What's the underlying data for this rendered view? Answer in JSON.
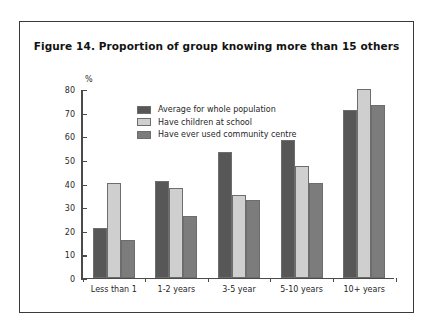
{
  "figure": {
    "title": "Figure 14. Proportion of group knowing more than 15 others"
  },
  "chart_data": {
    "type": "bar",
    "title": "Figure 14. Proportion of group knowing more than 15 others",
    "xlabel": "",
    "ylabel": "%",
    "ylim": [
      0,
      80
    ],
    "yticks": [
      0,
      10,
      20,
      30,
      40,
      50,
      60,
      70,
      80
    ],
    "grid": false,
    "legend_position": "inside-top-left",
    "categories": [
      "Less than 1",
      "1-2 years",
      "3-5 year",
      "5-10 years",
      "10+ years"
    ],
    "series": [
      {
        "name": "Average for whole population",
        "color": "#575757",
        "values": [
          21,
          41,
          53,
          58,
          71
        ]
      },
      {
        "name": "Have children at school",
        "color": "#cfcfcf",
        "values": [
          40,
          38,
          35,
          47,
          80
        ]
      },
      {
        "name": "Have ever used community centre",
        "color": "#7c7c7c",
        "values": [
          16,
          26,
          33,
          40,
          73
        ]
      }
    ]
  }
}
